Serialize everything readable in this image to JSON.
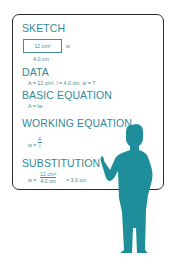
{
  "board": {
    "sections": [
      {
        "title": "SKETCH"
      },
      {
        "title": "DATA",
        "text": "A = 12 cm², l = 4.0 cm, w = ?"
      },
      {
        "title": "BASIC EQUATION",
        "text": "A = lw"
      },
      {
        "title": "WORKING EQUATION",
        "lhs": "w =",
        "numerator": "A",
        "denominator": "l"
      },
      {
        "title": "SUBSTITUTION",
        "lhs": "w =",
        "numerator": "12 cm²",
        "denominator": "4.0 cm",
        "result": "= 3.0 cm"
      }
    ],
    "sketch": {
      "area_label": "12 cm²",
      "width_label": "w",
      "length_label": "4.0 cm"
    }
  },
  "colors": {
    "accent": "#2f8a99",
    "figure": "#1e8f9a",
    "border": "#2a2a2a"
  }
}
